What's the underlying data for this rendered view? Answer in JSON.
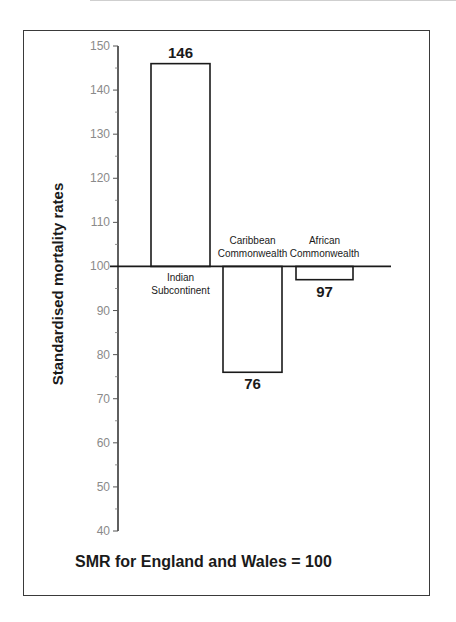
{
  "chart_data": {
    "type": "bar",
    "title": "",
    "xlabel": "",
    "ylabel": "Standardised mortality rates",
    "baseline": 100,
    "ylim": [
      40,
      150
    ],
    "yticks": [
      40,
      50,
      60,
      70,
      80,
      90,
      100,
      110,
      120,
      130,
      140,
      150
    ],
    "categories": [
      {
        "name": "Indian Subcontinent",
        "lines": [
          "Indian",
          "Subcontinent"
        ]
      },
      {
        "name": "Caribbean Commonwealth",
        "lines": [
          "Caribbean",
          "Commonwealth"
        ]
      },
      {
        "name": "African Commonwealth",
        "lines": [
          "African",
          "Commonwealth"
        ]
      }
    ],
    "values": [
      146,
      76,
      97
    ],
    "value_labels": [
      "146",
      "76",
      "97"
    ],
    "annotation": "SMR for England and Wales = 100",
    "grid": false,
    "legend": "none",
    "bar_fill": "#ffffff",
    "bar_stroke": "#1a1a1a"
  },
  "footnote": "SMR for England and Wales = 100"
}
